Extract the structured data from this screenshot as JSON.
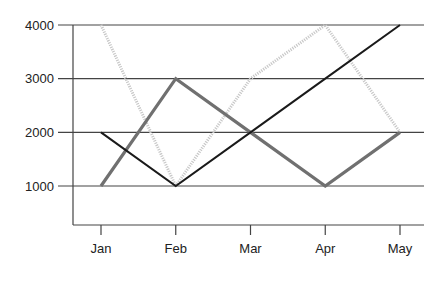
{
  "chart_data": {
    "type": "line",
    "title": "",
    "xlabel": "",
    "ylabel": "",
    "categories": [
      "Jan",
      "Feb",
      "Mar",
      "Apr",
      "May"
    ],
    "ylim": [
      750,
      4000
    ],
    "yticks": [
      1000,
      2000,
      3000,
      4000
    ],
    "ytick_labels": [
      "1000",
      "2000",
      "3000",
      "4000"
    ],
    "grid": "horizontal",
    "legend": "none",
    "series": [
      {
        "name": "Series 1",
        "values": [
          2000,
          1000,
          2000,
          3000,
          4000
        ],
        "color": "#1a1a1a",
        "style": "solid-thin"
      },
      {
        "name": "Series 2",
        "values": [
          1000,
          3000,
          2000,
          1000,
          2000
        ],
        "color": "#707070",
        "style": "solid-thick"
      },
      {
        "name": "Series 3",
        "values": [
          4000,
          1000,
          3000,
          4000,
          2000
        ],
        "color": "#c8c8c8",
        "style": "dotted"
      }
    ]
  }
}
